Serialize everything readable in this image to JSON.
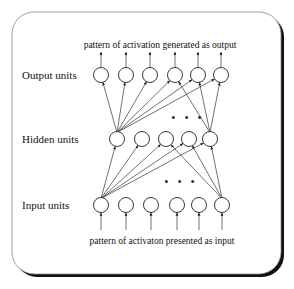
{
  "diagram": {
    "type": "feedforward-neural-network",
    "top_caption": "pattern of activation generated as output",
    "bottom_caption": "pattern of activaton presented as input",
    "layers": [
      {
        "id": "output",
        "label": "Output units",
        "node_count": 6
      },
      {
        "id": "hidden",
        "label": "Hidden units",
        "node_count": 5
      },
      {
        "id": "input",
        "label": "Input units",
        "node_count": 6
      }
    ],
    "ellipsis": "• • •",
    "connections": {
      "input_to_hidden": [
        {
          "from": 0,
          "to": 0
        },
        {
          "from": 0,
          "to": 1
        },
        {
          "from": 0,
          "to": 2
        },
        {
          "from": 0,
          "to": 3
        },
        {
          "from": 0,
          "to": 4
        },
        {
          "from": 5,
          "to": 2
        },
        {
          "from": 5,
          "to": 3
        },
        {
          "from": 5,
          "to": 4
        }
      ],
      "hidden_to_output": [
        {
          "from": 0,
          "to": 0
        },
        {
          "from": 0,
          "to": 1
        },
        {
          "from": 0,
          "to": 2
        },
        {
          "from": 0,
          "to": 3
        },
        {
          "from": 0,
          "to": 4
        },
        {
          "from": 0,
          "to": 5
        },
        {
          "from": 4,
          "to": 3
        },
        {
          "from": 4,
          "to": 4
        },
        {
          "from": 4,
          "to": 5
        }
      ]
    }
  }
}
